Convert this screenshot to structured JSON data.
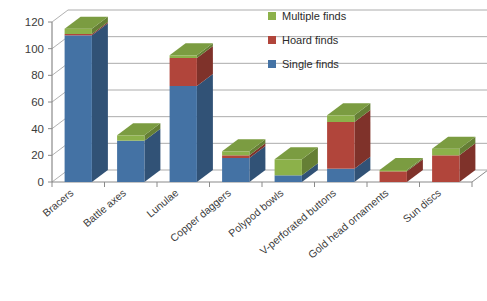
{
  "chart_data": {
    "type": "bar",
    "subtype": "stacked-3d-column",
    "title": "",
    "subtitle": "",
    "xlabel": "",
    "ylabel": "",
    "ylim": [
      0,
      120
    ],
    "ytick_step": 20,
    "yticks": [
      "0",
      "20",
      "40",
      "60",
      "80",
      "100",
      "120"
    ],
    "grid": true,
    "grid_axis": "y",
    "legend_position": "top-right",
    "categories": [
      "Bracers",
      "Battle axes",
      "Lunulae",
      "Copper daggers",
      "Polypod bowls",
      "V-perforated buttons",
      "Gold head ornaments",
      "Sun discs"
    ],
    "series": [
      {
        "name": "Single finds",
        "color": "#4472a4",
        "values": [
          110,
          31,
          72,
          18,
          5,
          10,
          0,
          0
        ]
      },
      {
        "name": "Hoard finds",
        "color": "#b1453b",
        "values": [
          1,
          0,
          21,
          2,
          0,
          35,
          8,
          20
        ]
      },
      {
        "name": "Multiple finds",
        "color": "#8cb14a",
        "values": [
          4,
          4,
          2,
          3,
          12,
          5,
          1,
          5
        ]
      }
    ],
    "totals": [
      115,
      35,
      95,
      23,
      17,
      50,
      9,
      25
    ]
  },
  "legend": {
    "items": [
      {
        "label": "Multiple finds",
        "color": "#8cb14a"
      },
      {
        "label": "Hoard finds",
        "color": "#b1453b"
      },
      {
        "label": "Single finds",
        "color": "#4472a4"
      }
    ]
  },
  "colors": {
    "single_finds": "#4472a4",
    "hoard_finds": "#b1453b",
    "multiple_finds": "#8cb14a",
    "gridline": "#9a9a9a",
    "axis": "#8a8a8a",
    "text": "#3b3b3b",
    "background": "#ffffff"
  }
}
